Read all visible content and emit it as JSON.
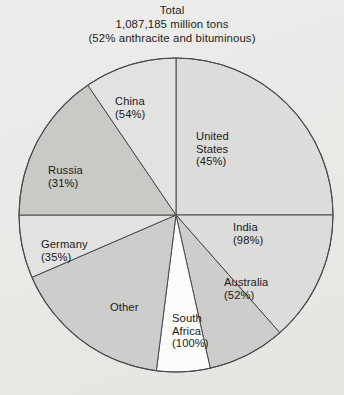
{
  "title": {
    "line1": "Total",
    "line2": "1,087,185 million tons",
    "line3": "(52% anthracite and bituminous)"
  },
  "labels": {
    "united_states": {
      "l1": "United",
      "l2": "States",
      "l3": "(45%)"
    },
    "india": {
      "l1": "India",
      "l2": "(98%)"
    },
    "australia": {
      "l1": "Australia",
      "l2": "(52%)"
    },
    "south_africa": {
      "l1": "South",
      "l2": "Africa",
      "l3": "(100%)"
    },
    "other": {
      "l1": "Other"
    },
    "germany": {
      "l1": "Germany",
      "l2": "(35%)"
    },
    "russia": {
      "l1": "Russia",
      "l2": "(31%)"
    },
    "china": {
      "l1": "China",
      "l2": "(54%)"
    }
  },
  "chart_data": {
    "type": "pie",
    "title": "Total 1,087,185 million tons (52% anthracite and bituminous)",
    "total_label": "1,087,185 million tons",
    "total_value": 1087185,
    "units": "million tons",
    "note": "52% anthracite and bituminous",
    "start_angle_deg": 0,
    "direction": "clockwise",
    "legend": "none-labels-on-slices",
    "grid": false,
    "categories": [
      "United States",
      "India",
      "Australia",
      "South Africa",
      "Other",
      "Germany",
      "Russia",
      "China"
    ],
    "values": [
      25.0,
      13.5,
      8.0,
      5.5,
      16.5,
      6.5,
      15.5,
      9.5
    ],
    "slices": [
      {
        "name": "United States",
        "share_pct": 25.0,
        "annotation_pct": 45,
        "start_deg": 0.0,
        "end_deg": 90.0,
        "color": "#dcdcda"
      },
      {
        "name": "India",
        "share_pct": 13.5,
        "annotation_pct": 98,
        "start_deg": 90.0,
        "end_deg": 138.6,
        "color": "#dcdcda"
      },
      {
        "name": "Australia",
        "share_pct": 8.0,
        "annotation_pct": 52,
        "start_deg": 138.6,
        "end_deg": 167.4,
        "color": "#cdcdcb"
      },
      {
        "name": "South Africa",
        "share_pct": 5.5,
        "annotation_pct": 100,
        "start_deg": 167.4,
        "end_deg": 187.2,
        "color": "#fbfbfa"
      },
      {
        "name": "Other",
        "share_pct": 16.5,
        "annotation_pct": null,
        "start_deg": 187.2,
        "end_deg": 246.6,
        "color": "#cdcdcb"
      },
      {
        "name": "Germany",
        "share_pct": 6.5,
        "annotation_pct": 35,
        "start_deg": 246.6,
        "end_deg": 270.0,
        "color": "#e2e2e0"
      },
      {
        "name": "Russia",
        "share_pct": 15.5,
        "annotation_pct": 31,
        "start_deg": 270.0,
        "end_deg": 325.8,
        "color": "#c9c9c6"
      },
      {
        "name": "China",
        "share_pct": 9.5,
        "annotation_pct": 54,
        "start_deg": 325.8,
        "end_deg": 360.0,
        "color": "#e2e2e0"
      }
    ],
    "center": {
      "x": 176,
      "y": 215
    },
    "radius": 157,
    "stroke_color": "#4a4a4a"
  }
}
